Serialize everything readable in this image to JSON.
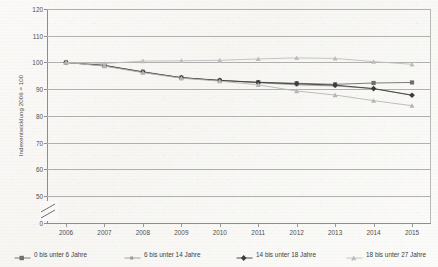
{
  "chart_data": {
    "type": "line",
    "title": "",
    "subtitle": "",
    "xlabel": "",
    "ylabel": "Indexentwicklung 2006 = 100",
    "categories": [
      "2006",
      "2007",
      "2008",
      "2009",
      "2010",
      "2011",
      "2012",
      "2013",
      "2014",
      "2015"
    ],
    "x": [
      2006,
      2007,
      2008,
      2009,
      2010,
      2011,
      2012,
      2013,
      2014,
      2015
    ],
    "ylim": [
      0,
      120
    ],
    "yticks": [
      0,
      50,
      60,
      70,
      80,
      90,
      100,
      110,
      120
    ],
    "ytick_labels": [
      "0",
      "50",
      "60",
      "70",
      "80",
      "90",
      "100",
      "110",
      "120"
    ],
    "axis_break": true,
    "axis_break_between": [
      0,
      50
    ],
    "grid": true,
    "grid_axis": "y",
    "legend_position": "bottom",
    "series": [
      {
        "name": "0 bis unter 6 Jahre",
        "marker": "square",
        "color": "#6e6e6e",
        "values": [
          100.0,
          98.8,
          96.5,
          94.3,
          93.2,
          92.6,
          92.2,
          91.8,
          92.3,
          92.5
        ]
      },
      {
        "name": "6 bis unter 14 Jahre",
        "marker": "square-small",
        "color": "#9a9a9a",
        "values": [
          100.0,
          98.7,
          96.3,
          94.2,
          93.2,
          92.4,
          91.6,
          91.2,
          90.2,
          87.8
        ]
      },
      {
        "name": "14 bis unter 18 Jahre",
        "marker": "diamond",
        "color": "#3c3c3c",
        "values": [
          100.0,
          98.9,
          96.4,
          94.3,
          93.3,
          92.5,
          92.0,
          91.5,
          90.2,
          87.7
        ]
      },
      {
        "name": "18 bis unter 27 Jahre",
        "marker": "triangle",
        "color": "#bdbdbd",
        "values": [
          100.0,
          99.6,
          100.5,
          100.6,
          100.8,
          101.3,
          101.7,
          101.5,
          100.3,
          99.3
        ]
      },
      {
        "name": "18 bis unter 27 Jahre (untere Linie)",
        "marker": "triangle",
        "color": "#b5b5b5",
        "hide_in_legend": true,
        "values": [
          100.0,
          98.6,
          96.2,
          94.1,
          93.0,
          91.6,
          89.3,
          87.8,
          85.7,
          83.8
        ]
      }
    ]
  },
  "legend": {
    "items": [
      {
        "label": "0 bis unter 6 Jahre"
      },
      {
        "label": "6 bis unter 14 Jahre"
      },
      {
        "label": "14 bis unter 18 Jahre"
      },
      {
        "label": "18 bis unter 27 Jahre"
      }
    ]
  }
}
